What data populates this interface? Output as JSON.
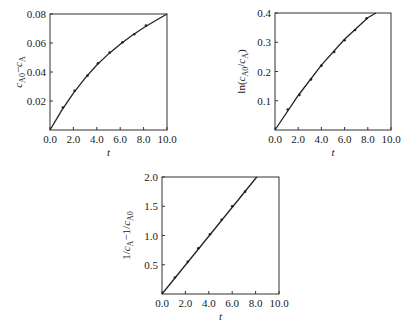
{
  "chart_data": [
    {
      "type": "line",
      "title": "",
      "xlabel": "t",
      "ylabel": "c_A0 - c_A",
      "xlim": [
        0,
        10
      ],
      "ylim": [
        0,
        0.08
      ],
      "xticks": [
        "0.0",
        "2.0",
        "4.0",
        "6.0",
        "8.0",
        "10.0"
      ],
      "yticks": [
        "0.02",
        "0.04",
        "0.06",
        "0.08"
      ],
      "grid": false,
      "series": [
        {
          "name": "data",
          "style": "points",
          "x": [
            1.1,
            2.1,
            3.2,
            4.1,
            5.1,
            6.2,
            7.2,
            8.2
          ],
          "y": [
            0.0155,
            0.027,
            0.0375,
            0.046,
            0.0535,
            0.0605,
            0.066,
            0.072
          ]
        },
        {
          "name": "fit",
          "style": "line",
          "x": [
            0,
            1,
            2,
            3,
            4,
            5,
            6,
            7,
            8,
            9,
            10
          ],
          "y": [
            0,
            0.0135,
            0.0255,
            0.0358,
            0.0448,
            0.0525,
            0.0592,
            0.0652,
            0.0705,
            0.0753,
            0.08
          ]
        }
      ]
    },
    {
      "type": "line",
      "title": "",
      "xlabel": "t",
      "ylabel": "ln(c_A0 / c_A)",
      "xlim": [
        0,
        10
      ],
      "ylim": [
        0,
        0.4
      ],
      "xticks": [
        "0.0",
        "2.0",
        "4.0",
        "6.0",
        "8.0",
        "10.0"
      ],
      "yticks": [
        "0.1",
        "0.2",
        "0.3",
        "0.4"
      ],
      "grid": false,
      "series": [
        {
          "name": "data",
          "style": "points",
          "x": [
            1.1,
            2.1,
            3.1,
            4.0,
            5.1,
            6.0,
            6.9,
            7.9
          ],
          "y": [
            0.07,
            0.12,
            0.173,
            0.22,
            0.267,
            0.307,
            0.342,
            0.382
          ]
        },
        {
          "name": "fit",
          "style": "line",
          "x": [
            0,
            2,
            4,
            6,
            8,
            8.7
          ],
          "y": [
            0,
            0.118,
            0.222,
            0.31,
            0.384,
            0.4
          ]
        }
      ]
    },
    {
      "type": "line",
      "title": "",
      "xlabel": "t",
      "ylabel": "1/c_A - 1/c_A0",
      "xlim": [
        0,
        10
      ],
      "ylim": [
        0,
        2.0
      ],
      "xticks": [
        "0.0",
        "2.0",
        "4.0",
        "6.0",
        "8.0",
        "10.0"
      ],
      "yticks": [
        "0.5",
        "1.0",
        "1.5",
        "2.0"
      ],
      "grid": false,
      "series": [
        {
          "name": "data",
          "style": "points",
          "x": [
            1.1,
            2.2,
            3.1,
            4.1,
            5.1,
            6.0,
            7.1
          ],
          "y": [
            0.28,
            0.55,
            0.78,
            1.02,
            1.27,
            1.5,
            1.75
          ]
        },
        {
          "name": "fit",
          "style": "line",
          "x": [
            0,
            8.1
          ],
          "y": [
            0,
            2.0
          ]
        }
      ]
    }
  ],
  "caption": ""
}
